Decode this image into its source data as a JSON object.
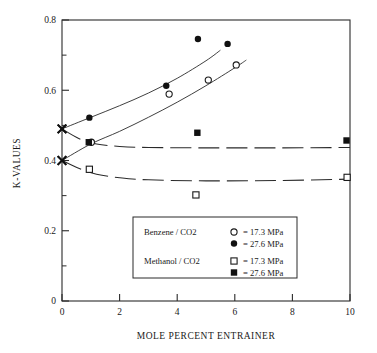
{
  "chart_data": {
    "type": "scatter",
    "title": "",
    "xlabel": "MOLE PERCENT ENTRAINER",
    "ylabel": "K-VALUES",
    "xlim": [
      0,
      10
    ],
    "ylim": [
      0,
      0.8
    ],
    "xticks": [
      0,
      2,
      4,
      6,
      8,
      10
    ],
    "yticks": [
      0,
      0.2,
      0.4,
      0.6,
      0.8
    ],
    "xtick_labels": [
      "0",
      "2",
      "4",
      "6",
      "8",
      "10"
    ],
    "ytick_labels": [
      "0",
      "0.2",
      "0.4",
      "0.6",
      "0.8"
    ],
    "minor_yticks": [
      0.1,
      0.3,
      0.5,
      0.7
    ],
    "grid": false,
    "legend_position": "lower-center",
    "series": [
      {
        "name": "Benzene / CO2 = 27.6 MPa",
        "marker": "filled-circle",
        "line": "solid",
        "points": [
          {
            "x": 0.0,
            "y": 0.49,
            "marker": "x-cross"
          },
          {
            "x": 0.95,
            "y": 0.522
          },
          {
            "x": 3.62,
            "y": 0.613
          },
          {
            "x": 4.72,
            "y": 0.746
          },
          {
            "x": 5.75,
            "y": 0.732
          }
        ],
        "curve": [
          {
            "x": 0.0,
            "y": 0.49
          },
          {
            "x": 1.0,
            "y": 0.523
          },
          {
            "x": 2.0,
            "y": 0.556
          },
          {
            "x": 3.0,
            "y": 0.592
          },
          {
            "x": 4.0,
            "y": 0.634
          },
          {
            "x": 5.0,
            "y": 0.684
          },
          {
            "x": 5.5,
            "y": 0.714
          }
        ]
      },
      {
        "name": "Benzene / CO2 = 17.3 MPa",
        "marker": "open-circle",
        "line": "solid",
        "points": [
          {
            "x": 0.0,
            "y": 0.4,
            "marker": "x-cross"
          },
          {
            "x": 1.02,
            "y": 0.452
          },
          {
            "x": 3.72,
            "y": 0.589
          },
          {
            "x": 5.08,
            "y": 0.629
          },
          {
            "x": 6.05,
            "y": 0.672
          }
        ],
        "curve": [
          {
            "x": 0.0,
            "y": 0.4
          },
          {
            "x": 1.0,
            "y": 0.447
          },
          {
            "x": 2.0,
            "y": 0.483
          },
          {
            "x": 3.0,
            "y": 0.523
          },
          {
            "x": 4.0,
            "y": 0.566
          },
          {
            "x": 5.0,
            "y": 0.613
          },
          {
            "x": 6.0,
            "y": 0.664
          },
          {
            "x": 6.4,
            "y": 0.686
          }
        ]
      },
      {
        "name": "Methanol / CO2 = 27.6 MPa",
        "marker": "filled-square",
        "line": "dashed",
        "points": [
          {
            "x": 0.0,
            "y": 0.49,
            "marker": "x-cross"
          },
          {
            "x": 0.93,
            "y": 0.452
          },
          {
            "x": 4.7,
            "y": 0.479
          },
          {
            "x": 9.88,
            "y": 0.457
          }
        ],
        "curve": [
          {
            "x": 0.0,
            "y": 0.49
          },
          {
            "x": 0.6,
            "y": 0.462
          },
          {
            "x": 1.2,
            "y": 0.447
          },
          {
            "x": 2.0,
            "y": 0.44
          },
          {
            "x": 3.0,
            "y": 0.437
          },
          {
            "x": 5.0,
            "y": 0.436
          },
          {
            "x": 7.5,
            "y": 0.436
          },
          {
            "x": 10.0,
            "y": 0.437
          }
        ]
      },
      {
        "name": "Methanol / CO2 = 17.3 MPa",
        "marker": "open-square",
        "line": "dashed",
        "points": [
          {
            "x": 0.0,
            "y": 0.4,
            "marker": "x-cross"
          },
          {
            "x": 0.95,
            "y": 0.375
          },
          {
            "x": 4.65,
            "y": 0.302
          },
          {
            "x": 9.9,
            "y": 0.352
          }
        ],
        "curve": [
          {
            "x": 0.0,
            "y": 0.4
          },
          {
            "x": 0.6,
            "y": 0.377
          },
          {
            "x": 1.2,
            "y": 0.361
          },
          {
            "x": 2.0,
            "y": 0.351
          },
          {
            "x": 3.0,
            "y": 0.345
          },
          {
            "x": 5.0,
            "y": 0.342
          },
          {
            "x": 7.5,
            "y": 0.343
          },
          {
            "x": 10.0,
            "y": 0.347
          }
        ]
      }
    ],
    "annotations": [
      {
        "label": "x-marker-pure-27.6",
        "x": 0.0,
        "y": 0.49
      },
      {
        "label": "x-marker-pure-17.3",
        "x": 0.0,
        "y": 0.4
      }
    ]
  },
  "legend": {
    "rows": [
      {
        "system": "Benzene / CO2",
        "marker": "open-circle",
        "value": "= 17.3 MPa"
      },
      {
        "system": "",
        "marker": "filled-circle",
        "value": "= 27.6 MPa"
      },
      {
        "system": "Methanol / CO2",
        "marker": "open-square",
        "value": "= 17.3 MPa"
      },
      {
        "system": "",
        "marker": "filled-square",
        "value": "= 27.6 MPa"
      }
    ]
  },
  "colors": {
    "ink": "#1a1a1a",
    "axis": "#2a2a2a",
    "background": "#ffffff"
  }
}
